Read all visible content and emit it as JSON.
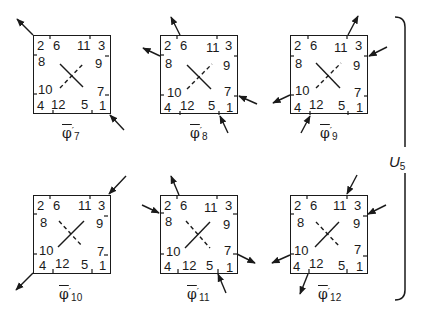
{
  "figure": {
    "group_label": "U",
    "group_subscript": "5",
    "panels": [
      {
        "id": "phi7",
        "symbol": "φ",
        "prime": "′",
        "subscript": "7",
        "row": 0,
        "col": 0,
        "crossing": "solid-backslash-dashed-slash",
        "grid": [
          [
            "2",
            "6",
            "11",
            "3"
          ],
          [
            "8",
            "",
            "",
            "9"
          ],
          [
            "10",
            "",
            "",
            "7"
          ],
          [
            "4",
            "12",
            "5",
            "1"
          ]
        ],
        "arrows": [
          {
            "at": "2",
            "position": "top-left-corner",
            "direction": "out"
          },
          {
            "at": "1",
            "position": "bottom-right-corner",
            "direction": "in"
          }
        ]
      },
      {
        "id": "phi8",
        "symbol": "φ",
        "prime": "′",
        "subscript": "8",
        "row": 0,
        "col": 1,
        "crossing": "solid-backslash-dashed-slash",
        "grid": [
          [
            "2",
            "6",
            "11",
            "3"
          ],
          [
            "8",
            "",
            "",
            "9"
          ],
          [
            "10",
            "",
            "",
            "7"
          ],
          [
            "4",
            "12",
            "5",
            "1"
          ]
        ],
        "arrows": [
          {
            "at": "6",
            "position": "top",
            "direction": "out"
          },
          {
            "at": "8",
            "position": "left",
            "direction": "out"
          },
          {
            "at": "7",
            "position": "right",
            "direction": "in"
          },
          {
            "at": "5",
            "position": "bottom",
            "direction": "in"
          }
        ]
      },
      {
        "id": "phi9",
        "symbol": "φ",
        "prime": "′",
        "subscript": "9",
        "row": 0,
        "col": 2,
        "crossing": "solid-backslash-dashed-slash",
        "grid": [
          [
            "2",
            "6",
            "11",
            "3"
          ],
          [
            "8",
            "",
            "",
            "9"
          ],
          [
            "10",
            "",
            "",
            "7"
          ],
          [
            "4",
            "12",
            "5",
            "1"
          ]
        ],
        "arrows": [
          {
            "at": "11",
            "position": "top",
            "direction": "out"
          },
          {
            "at": "9",
            "position": "right",
            "direction": "in"
          },
          {
            "at": "10",
            "position": "left",
            "direction": "out"
          },
          {
            "at": "12",
            "position": "bottom",
            "direction": "in"
          }
        ]
      },
      {
        "id": "phi10",
        "symbol": "φ",
        "prime": "′",
        "subscript": "10",
        "row": 1,
        "col": 0,
        "crossing": "solid-slash-dashed-backslash",
        "grid": [
          [
            "2",
            "6",
            "11",
            "3"
          ],
          [
            "8",
            "",
            "",
            "9"
          ],
          [
            "10",
            "",
            "",
            "7"
          ],
          [
            "4",
            "12",
            "5",
            "1"
          ]
        ],
        "arrows": [
          {
            "at": "3",
            "position": "top-right-corner",
            "direction": "in"
          },
          {
            "at": "4",
            "position": "bottom-left-corner",
            "direction": "out"
          }
        ]
      },
      {
        "id": "phi11",
        "symbol": "φ",
        "prime": "′",
        "subscript": "11",
        "row": 1,
        "col": 1,
        "crossing": "solid-slash-dashed-backslash",
        "grid": [
          [
            "2",
            "6",
            "11",
            "3"
          ],
          [
            "8",
            "",
            "",
            "9"
          ],
          [
            "10",
            "",
            "",
            "7"
          ],
          [
            "4",
            "12",
            "5",
            "1"
          ]
        ],
        "arrows": [
          {
            "at": "6",
            "position": "top",
            "direction": "out"
          },
          {
            "at": "8",
            "position": "left",
            "direction": "in"
          },
          {
            "at": "7",
            "position": "right",
            "direction": "out"
          },
          {
            "at": "5",
            "position": "bottom",
            "direction": "in"
          }
        ]
      },
      {
        "id": "phi12",
        "symbol": "φ",
        "prime": "′",
        "subscript": "12",
        "row": 1,
        "col": 2,
        "crossing": "solid-slash-dashed-backslash",
        "grid": [
          [
            "2",
            "6",
            "11",
            "3"
          ],
          [
            "8",
            "",
            "",
            "9"
          ],
          [
            "10",
            "",
            "",
            "7"
          ],
          [
            "4",
            "12",
            "5",
            "1"
          ]
        ],
        "arrows": [
          {
            "at": "11",
            "position": "top",
            "direction": "in"
          },
          {
            "at": "9",
            "position": "right",
            "direction": "in"
          },
          {
            "at": "10",
            "position": "left",
            "direction": "out"
          },
          {
            "at": "12",
            "position": "bottom",
            "direction": "out"
          }
        ]
      }
    ]
  }
}
